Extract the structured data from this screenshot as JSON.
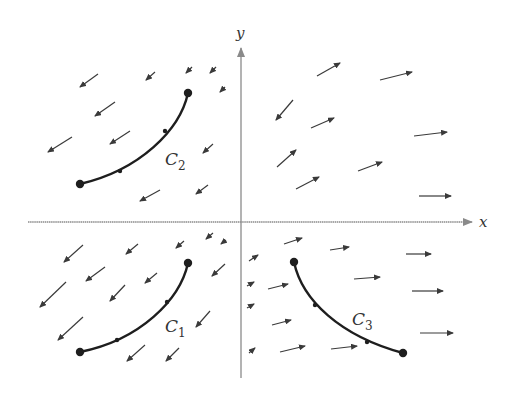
{
  "diagram": {
    "type": "vector-field",
    "colors": {
      "axis": "#8a8a8a",
      "vector": "#3a3a3a",
      "curve": "#1e1e1e",
      "text": "#333333"
    },
    "axes": {
      "origin": [
        241,
        222
      ],
      "x_axis": {
        "label": "x",
        "from": [
          28,
          222
        ],
        "to": [
          472,
          222
        ],
        "label_pos": [
          479,
          227
        ]
      },
      "y_axis": {
        "label": "y",
        "from": [
          241,
          378
        ],
        "to": [
          241,
          48
        ],
        "label_pos": [
          236,
          38
        ]
      }
    },
    "curves": [
      {
        "name": "C2",
        "label": "C",
        "subscript": "2",
        "label_pos": [
          165,
          165
        ],
        "path": "M 188 93 C 180 130, 140 170, 80 184",
        "start": [
          188,
          93
        ],
        "end": [
          80,
          184
        ],
        "direction_marks": [
          [
            165,
            131
          ],
          [
            120,
            171
          ]
        ]
      },
      {
        "name": "C1",
        "label": "C",
        "subscript": "1",
        "label_pos": [
          165,
          332
        ],
        "path": "M 188 263 C 180 300, 140 340, 80 352",
        "start": [
          188,
          263
        ],
        "end": [
          80,
          352
        ],
        "direction_marks": [
          [
            167,
            302
          ],
          [
            117,
            340
          ]
        ]
      },
      {
        "name": "C3",
        "label": "C",
        "subscript": "3",
        "label_pos": [
          352,
          325
        ],
        "path": "M 294 262 C 302 300, 340 336, 403 353",
        "start": [
          294,
          262
        ],
        "end": [
          403,
          353
        ],
        "direction_marks": [
          [
            315,
            305
          ],
          [
            367,
            342
          ]
        ]
      }
    ],
    "vectors": [
      [
        98,
        74,
        80,
        87
      ],
      [
        155,
        72,
        146,
        80
      ],
      [
        192,
        67,
        186,
        73
      ],
      [
        216,
        67,
        210,
        73
      ],
      [
        225,
        87,
        220,
        92
      ],
      [
        115,
        102,
        95,
        116
      ],
      [
        130,
        131,
        110,
        144
      ],
      [
        72,
        137,
        48,
        152
      ],
      [
        213,
        144,
        203,
        153
      ],
      [
        208,
        185,
        196,
        194
      ],
      [
        160,
        190,
        140,
        201
      ],
      [
        293,
        100,
        276,
        120
      ],
      [
        317,
        76,
        340,
        63
      ],
      [
        380,
        80,
        412,
        72
      ],
      [
        311,
        128,
        334,
        118
      ],
      [
        414,
        136,
        447,
        132
      ],
      [
        277,
        167,
        296,
        150
      ],
      [
        296,
        189,
        319,
        177
      ],
      [
        358,
        171,
        382,
        162
      ],
      [
        419,
        196,
        451,
        196
      ],
      [
        83,
        245,
        64,
        262
      ],
      [
        138,
        244,
        126,
        254
      ],
      [
        184,
        241,
        176,
        248
      ],
      [
        213,
        233,
        206,
        239
      ],
      [
        226,
        240,
        221,
        244
      ],
      [
        105,
        267,
        86,
        281
      ],
      [
        157,
        273,
        145,
        283
      ],
      [
        225,
        264,
        212,
        276
      ],
      [
        66,
        282,
        40,
        307
      ],
      [
        125,
        285,
        110,
        301
      ],
      [
        83,
        317,
        58,
        340
      ],
      [
        210,
        311,
        196,
        327
      ],
      [
        145,
        345,
        127,
        361
      ],
      [
        179,
        348,
        166,
        361
      ],
      [
        249,
        261,
        258,
        255
      ],
      [
        284,
        244,
        302,
        238
      ],
      [
        330,
        250,
        349,
        247
      ],
      [
        406,
        254,
        431,
        254
      ],
      [
        247,
        286,
        254,
        282
      ],
      [
        268,
        289,
        288,
        284
      ],
      [
        354,
        279,
        380,
        277
      ],
      [
        412,
        291,
        443,
        291
      ],
      [
        247,
        308,
        254,
        304
      ],
      [
        272,
        325,
        291,
        320
      ],
      [
        420,
        333,
        453,
        333
      ],
      [
        249,
        353,
        255,
        348
      ],
      [
        280,
        352,
        305,
        346
      ],
      [
        331,
        349,
        357,
        346
      ]
    ]
  }
}
